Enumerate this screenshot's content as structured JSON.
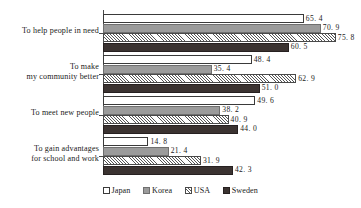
{
  "chart_data": {
    "type": "bar",
    "orientation": "horizontal",
    "title": "",
    "xlabel": "",
    "ylabel": "",
    "grid": false,
    "xlim": [
      0,
      84
    ],
    "legend_position": "bottom",
    "categories": [
      "To help people in need",
      "To make\nmy community better",
      "To meet new people",
      "To gain advantages\nfor school and work"
    ],
    "series": [
      {
        "name": "Japan",
        "values": [
          65.4,
          48.4,
          49.6,
          14.8
        ],
        "pattern": "open",
        "color": "#ffffff"
      },
      {
        "name": "Korea",
        "values": [
          70.9,
          35.4,
          38.2,
          21.4
        ],
        "pattern": "solid",
        "color": "#9b9b9b"
      },
      {
        "name": "USA",
        "values": [
          75.8,
          62.9,
          40.9,
          31.9
        ],
        "pattern": "hatched",
        "color": "#ffffff"
      },
      {
        "name": "Sweden",
        "values": [
          60.5,
          51.0,
          44.0,
          42.3
        ],
        "pattern": "solid",
        "color": "#3b3331"
      }
    ],
    "value_labels": [
      [
        "65. 4",
        "70. 9",
        "75. 8",
        "60. 5"
      ],
      [
        "48. 4",
        "35. 4",
        "62. 9",
        "51. 0"
      ],
      [
        "49. 6",
        "38. 2",
        "40. 9",
        "44. 0"
      ],
      [
        "14. 8",
        "21. 4",
        "31. 9",
        "42. 3"
      ]
    ]
  },
  "legend": {
    "items": [
      {
        "label": "Japan",
        "key": "japan"
      },
      {
        "label": "Korea",
        "key": "korea"
      },
      {
        "label": "USA",
        "key": "usa"
      },
      {
        "label": "Sweden",
        "key": "sweden"
      }
    ]
  }
}
